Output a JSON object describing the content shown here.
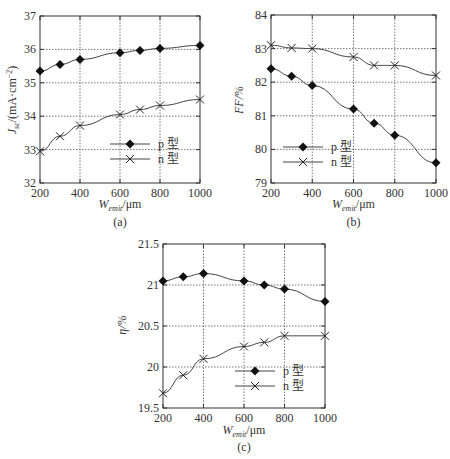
{
  "chart_data": [
    {
      "id": "a",
      "type": "line",
      "caption": "(a)",
      "xlabel": "W_emit/μm",
      "ylabel": "J_sc/(mA·cm⁻²)",
      "xlim": [
        200,
        1000
      ],
      "ylim": [
        32,
        37
      ],
      "xticks": [
        200,
        400,
        600,
        800,
        1000
      ],
      "yticks": [
        32,
        33,
        34,
        35,
        36,
        37
      ],
      "grid": true,
      "legend_position": "lower right",
      "series": [
        {
          "name": "p 型",
          "marker": "diamond",
          "x": [
            200,
            300,
            400,
            600,
            700,
            800,
            1000
          ],
          "values": [
            35.35,
            35.55,
            35.7,
            35.9,
            35.97,
            36.03,
            36.12
          ]
        },
        {
          "name": "n 型",
          "marker": "x",
          "x": [
            200,
            300,
            400,
            600,
            700,
            800,
            1000
          ],
          "values": [
            32.95,
            33.4,
            33.72,
            34.05,
            34.2,
            34.32,
            34.5
          ]
        }
      ]
    },
    {
      "id": "b",
      "type": "line",
      "caption": "(b)",
      "xlabel": "W_emit/μm",
      "ylabel": "FF/%",
      "xlim": [
        200,
        1000
      ],
      "ylim": [
        79,
        84
      ],
      "xticks": [
        200,
        400,
        600,
        800,
        1000
      ],
      "yticks": [
        79,
        80,
        81,
        82,
        83,
        84
      ],
      "grid": true,
      "legend_position": "lower left",
      "series": [
        {
          "name": "p 型",
          "marker": "diamond",
          "x": [
            200,
            300,
            400,
            600,
            700,
            800,
            1000
          ],
          "values": [
            82.4,
            82.18,
            81.9,
            81.2,
            80.78,
            80.42,
            79.6
          ]
        },
        {
          "name": "n 型",
          "marker": "x",
          "x": [
            200,
            300,
            400,
            600,
            700,
            800,
            1000
          ],
          "values": [
            83.1,
            83.02,
            83.0,
            82.75,
            82.5,
            82.5,
            82.2
          ]
        }
      ]
    },
    {
      "id": "c",
      "type": "line",
      "caption": "(c)",
      "xlabel": "W_emit/μm",
      "ylabel": "η/%",
      "xlim": [
        200,
        1000
      ],
      "ylim": [
        19.5,
        21.5
      ],
      "xticks": [
        200,
        400,
        600,
        800,
        1000
      ],
      "yticks": [
        19.5,
        20,
        20.5,
        21,
        21.5
      ],
      "grid": true,
      "legend_position": "lower right",
      "series": [
        {
          "name": "p 型",
          "marker": "diamond",
          "x": [
            200,
            300,
            400,
            600,
            700,
            800,
            1000
          ],
          "values": [
            21.05,
            21.1,
            21.14,
            21.05,
            21.0,
            20.95,
            20.8
          ]
        },
        {
          "name": "n 型",
          "marker": "x",
          "x": [
            200,
            300,
            400,
            600,
            700,
            800,
            1000
          ],
          "values": [
            19.68,
            19.9,
            20.1,
            20.25,
            20.3,
            20.38,
            20.38
          ]
        }
      ]
    }
  ],
  "labels": {
    "a": {
      "caption": "(a)",
      "ylabel_main": "J",
      "ylabel_sub": "sc",
      "ylabel_rest": "/(mA·cm",
      "ylabel_sup": "−2",
      "ylabel_end": ")",
      "xlabel_main": "W",
      "xlabel_sub": "emit",
      "xlabel_rest": "/μm"
    },
    "b": {
      "caption": "(b)",
      "ylabel": "FF/%",
      "xlabel_main": "W",
      "xlabel_sub": "emit",
      "xlabel_rest": "/μm"
    },
    "c": {
      "caption": "(c)",
      "ylabel": "η/%",
      "xlabel_main": "W",
      "xlabel_sub": "emit",
      "xlabel_rest": "/μm"
    },
    "legend_p": "p 型",
    "legend_n": "n 型"
  }
}
